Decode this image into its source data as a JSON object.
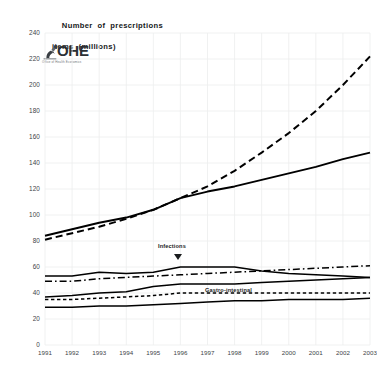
{
  "figure": {
    "title_line1": "Number  of  prescriptions",
    "title_line2": "items  (millions)",
    "logo": {
      "wordmark": "OHE",
      "subtitle": "Office of Health Economics",
      "icon_name": "ohe-microscope-logo"
    },
    "annotations": [
      {
        "id": "infections",
        "label": "Infections"
      },
      {
        "id": "gastro",
        "label": "Gastro-intestinal"
      }
    ]
  },
  "chart_data": {
    "type": "line",
    "title": "Number of prescriptions items (millions)",
    "xlabel": "",
    "ylabel": "Number of prescriptions items (millions)",
    "x": [
      1991,
      1992,
      1993,
      1994,
      1995,
      1996,
      1997,
      1998,
      1999,
      2000,
      2001,
      2002,
      2003
    ],
    "categories": [
      "1991",
      "1992",
      "1993",
      "1994",
      "1995",
      "1996",
      "1997",
      "1998",
      "1999",
      "2000",
      "2001",
      "2002",
      "2003"
    ],
    "ylim": [
      0,
      240
    ],
    "yticks": [
      0,
      20,
      40,
      60,
      80,
      100,
      120,
      140,
      160,
      180,
      200,
      220,
      240
    ],
    "xlim": [
      1991,
      2003
    ],
    "grid": true,
    "legend": "none",
    "series": [
      {
        "name": "Total prescription items (solid)",
        "style": "solid",
        "values": [
          84,
          89,
          94,
          98,
          104,
          113,
          118,
          122,
          127,
          132,
          137,
          143,
          148
        ]
      },
      {
        "name": "Net ingredient cost (dashed)",
        "style": "dashed",
        "values": [
          81,
          86,
          91,
          97,
          104,
          113,
          122,
          134,
          148,
          163,
          180,
          200,
          222
        ]
      },
      {
        "name": "Cardiovascular (solid upper band)",
        "style": "solid",
        "values": [
          53,
          53,
          56,
          55,
          56,
          60,
          60,
          60,
          57,
          55,
          54,
          53,
          52
        ]
      },
      {
        "name": "Central nervous system (dash-dot)",
        "style": "dash-dot",
        "values": [
          49,
          49,
          51,
          52,
          53,
          54,
          55,
          56,
          57,
          58,
          59,
          60,
          61
        ]
      },
      {
        "name": "Infections (solid middle band)",
        "style": "solid",
        "values": [
          37,
          38,
          40,
          41,
          45,
          47,
          47,
          47,
          48,
          49,
          50,
          51,
          52
        ]
      },
      {
        "name": "Gastro-intestinal (short dash)",
        "style": "short-dash",
        "values": [
          35,
          35,
          36,
          37,
          38,
          40,
          40,
          40,
          40,
          40,
          40,
          40,
          40
        ]
      },
      {
        "name": "Respiratory (solid lower band)",
        "style": "solid",
        "values": [
          29,
          29,
          30,
          30,
          31,
          32,
          33,
          34,
          34,
          35,
          35,
          35,
          36
        ]
      }
    ]
  }
}
